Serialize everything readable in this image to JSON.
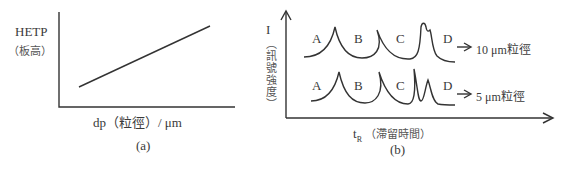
{
  "panel_a": {
    "caption": "(a)",
    "y_label": "HETP",
    "y_label_sub": "（板高）",
    "x_label": "dp（粒徑）/ μm",
    "line": {
      "from": "low dp, low HETP",
      "to": "high dp, high HETP",
      "trend": "linear increasing"
    }
  },
  "panel_b": {
    "caption": "(b)",
    "y_label": "I",
    "y_label_sub": "（訊號強度）",
    "x_label_main": "t",
    "x_label_subscript": "R",
    "x_label_cjk": "（滯留時間）",
    "traces": [
      {
        "name": "10 μm粒徑",
        "peaks": [
          "A",
          "B",
          "C",
          "D"
        ],
        "note": "C and D peaks poorly resolved (merged)"
      },
      {
        "name": "5 μm粒徑",
        "peaks": [
          "A",
          "B",
          "C",
          "D"
        ],
        "note": "C and D peaks resolved"
      }
    ]
  },
  "colors": {
    "line": "#333333",
    "text": "#3a3a3a",
    "cjk_text": "#555555",
    "background": "#ffffff"
  }
}
